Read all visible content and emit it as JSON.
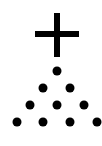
{
  "figure": {
    "symbol": "plus-sign",
    "color": "#000000",
    "background": "#ffffff",
    "rows": [
      {
        "count": 1,
        "y": 71,
        "xs": [
          57
        ]
      },
      {
        "count": 2,
        "y": 88,
        "xs": [
          43,
          70
        ]
      },
      {
        "count": 3,
        "y": 105,
        "xs": [
          30,
          57,
          84
        ]
      },
      {
        "count": 4,
        "y": 122,
        "xs": [
          17,
          43,
          70,
          97
        ]
      }
    ],
    "total_dots": 10
  }
}
